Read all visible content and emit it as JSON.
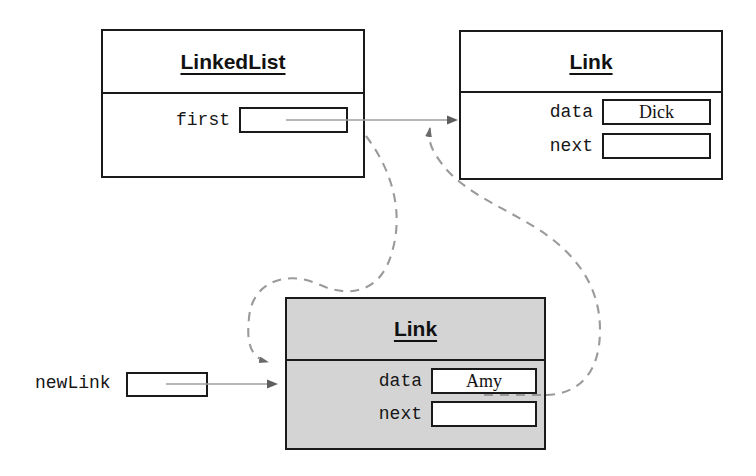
{
  "diagram": {
    "type": "object-reference-diagram",
    "colors": {
      "stroke": "#1a1a1a",
      "shaded_fill": "#d4d4d4",
      "pointer_line": "#8a8a8a",
      "dashed_line": "#9a9a9a",
      "background": "#ffffff"
    }
  },
  "objects": [
    {
      "id": "linkedlist",
      "title": "LinkedList",
      "shaded": false,
      "fields": [
        {
          "label": "first",
          "value": "",
          "has_pointer": true
        }
      ]
    },
    {
      "id": "link_dick",
      "title": "Link",
      "shaded": false,
      "fields": [
        {
          "label": "data",
          "value": "Dick",
          "has_pointer": false
        },
        {
          "label": "next",
          "value": "",
          "has_pointer": false
        }
      ]
    },
    {
      "id": "link_amy",
      "title": "Link",
      "shaded": true,
      "fields": [
        {
          "label": "data",
          "value": "Amy",
          "has_pointer": false
        },
        {
          "label": "next",
          "value": "",
          "has_pointer": true
        }
      ]
    }
  ],
  "reference_variable": {
    "label": "newLink",
    "value": "",
    "points_to": "link_amy"
  },
  "connections": [
    {
      "id": "first-to-dick",
      "from": "linkedlist.first",
      "to": "link_dick",
      "style": "solid",
      "arrow": true
    },
    {
      "id": "newlink-to-amy",
      "from": "newLink",
      "to": "link_amy",
      "style": "solid",
      "arrow": true
    },
    {
      "id": "first-to-amy-new",
      "from": "linkedlist.first",
      "to": "link_amy",
      "style": "dashed",
      "arrow": true
    },
    {
      "id": "amy-next-to-dick",
      "from": "link_amy.next",
      "to": "link_dick",
      "style": "dashed",
      "arrow": true
    }
  ]
}
